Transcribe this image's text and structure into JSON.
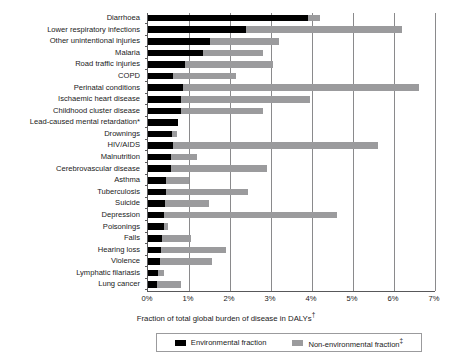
{
  "chart_data": {
    "type": "bar",
    "orientation": "horizontal",
    "stacked": true,
    "title": "",
    "xlabel": "Fraction of total global burden of disease in DALYs†",
    "ylabel": "",
    "xlim": [
      0,
      7
    ],
    "xunit": "%",
    "xticks": [
      0,
      1,
      2,
      3,
      4,
      5,
      6,
      7
    ],
    "xticklabels": [
      "0%",
      "1%",
      "2%",
      "3%",
      "4%",
      "5%",
      "6%",
      "7%"
    ],
    "grid": "vertical",
    "legend_position": "bottom",
    "legend": [
      {
        "name": "Environmental fraction",
        "color": "#000000"
      },
      {
        "name": "Non-environmental fraction‡",
        "color": "#9b9b9d"
      }
    ],
    "categories": [
      "Diarrhoea",
      "Lower respiratory infections",
      "Other unintentional injuries",
      "Malaria",
      "Road traffic injuries",
      "COPD",
      "Perinatal conditions",
      "Ischaemic heart disease",
      "Childhood cluster disease",
      "Lead-caused mental retardation*",
      "Drownings",
      "HIV/AIDS",
      "Malnutrition",
      "Cerebrovascular disease",
      "Asthma",
      "Tuberculosis",
      "Suicide",
      "Depression",
      "Poisonings",
      "Falls",
      "Hearing loss",
      "Violence",
      "Lymphatic filariasis",
      "Lung cancer"
    ],
    "series": [
      {
        "name": "Environmental fraction",
        "color": "#000000",
        "values": [
          3.9,
          2.4,
          1.5,
          1.35,
          0.9,
          0.6,
          0.85,
          0.8,
          0.8,
          0.72,
          0.58,
          0.6,
          0.55,
          0.55,
          0.45,
          0.45,
          0.42,
          0.4,
          0.38,
          0.35,
          0.32,
          0.3,
          0.25,
          0.22
        ],
        "unit": "%"
      },
      {
        "name": "Non-environmental fraction‡",
        "color": "#9b9b9d",
        "values": [
          0.3,
          3.8,
          1.7,
          1.45,
          2.15,
          1.55,
          5.75,
          3.15,
          2.0,
          0.0,
          0.12,
          5.0,
          0.65,
          2.35,
          0.55,
          2.0,
          1.08,
          4.2,
          0.12,
          0.7,
          1.58,
          1.25,
          0.15,
          0.58
        ],
        "unit": "%"
      }
    ],
    "totals": [
      4.2,
      6.2,
      3.2,
      2.8,
      3.05,
      2.15,
      6.6,
      3.95,
      2.8,
      0.72,
      0.7,
      5.6,
      1.2,
      2.9,
      1.0,
      2.45,
      1.5,
      4.6,
      0.5,
      1.05,
      1.9,
      1.55,
      0.4,
      0.8
    ]
  },
  "footnotes": {
    "lead_marker": "*",
    "dalys_marker": "†",
    "nonenv_marker": "‡"
  }
}
